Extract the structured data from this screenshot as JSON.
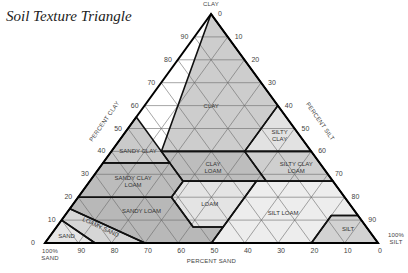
{
  "title": "Soil Texture Triangle",
  "vertices": {
    "clay": {
      "x": 211,
      "y": 14,
      "label": [
        "100%",
        "CLAY"
      ]
    },
    "sand": {
      "x": 45,
      "y": 243,
      "label": [
        "100%",
        "SAND"
      ]
    },
    "silt": {
      "x": 378,
      "y": 243,
      "label": [
        "100%",
        "SILT"
      ]
    }
  },
  "axes": {
    "clay": {
      "title": "PERCENT CLAY",
      "ticks": [
        0,
        10,
        20,
        30,
        40,
        50,
        60,
        70,
        80,
        90
      ]
    },
    "silt": {
      "title": "PERCENT SILT",
      "ticks": [
        0,
        10,
        20,
        30,
        40,
        50,
        60,
        70,
        80,
        90
      ]
    },
    "sand": {
      "title": "PERCENT SAND",
      "ticks": [
        90,
        80,
        70,
        60,
        50,
        40,
        30,
        20,
        10,
        0
      ]
    }
  },
  "regions": [
    {
      "name": "CLAY",
      "fill": "#cdcdcd",
      "label": [
        "CLAY"
      ],
      "label_at": [
        60,
        20
      ],
      "poly": [
        [
          100,
          0
        ],
        [
          40,
          45
        ],
        [
          40,
          20
        ],
        [
          55,
          0
        ],
        [
          60,
          0
        ]
      ],
      "pts": [
        [
          100,
          0,
          0
        ],
        [
          40,
          45,
          15
        ],
        [
          40,
          20,
          40
        ],
        [
          60,
          0,
          40
        ]
      ]
    },
    {
      "name": "SANDY CLAY",
      "fill": "#cacaca",
      "label": [
        "SANDY CLAY"
      ],
      "label_at": [
        40,
        52
      ],
      "pts": [
        [
          55,
          45,
          0
        ],
        [
          35,
          45,
          20
        ],
        [
          35,
          65,
          0
        ]
      ]
    },
    {
      "name": "SILTY CLAY",
      "fill": "#e2e2e2",
      "label": [
        "SILTY",
        "CLAY"
      ],
      "label_at": [
        47,
        6
      ],
      "pts": [
        [
          60,
          0,
          40
        ],
        [
          40,
          20,
          40
        ],
        [
          40,
          0,
          60
        ]
      ]
    },
    {
      "name": "CLAY LOAM",
      "fill": "#bdbdbd",
      "label": [
        "CLAY",
        "LOAM"
      ],
      "label_at": [
        33,
        33
      ],
      "pts": [
        [
          40,
          45,
          15
        ],
        [
          27,
          45,
          28
        ],
        [
          27,
          20,
          53
        ],
        [
          40,
          20,
          40
        ]
      ]
    },
    {
      "name": "SILTY CLAY LOAM",
      "fill": "#cfcfcf",
      "label": [
        "SILTY CLAY",
        "LOAM"
      ],
      "label_at": [
        33,
        8
      ],
      "pts": [
        [
          40,
          20,
          40
        ],
        [
          27,
          20,
          53
        ],
        [
          27,
          0,
          73
        ],
        [
          40,
          0,
          60
        ]
      ]
    },
    {
      "name": "SANDY CLAY LOAM",
      "fill": "#bcbcbc",
      "label": [
        "SANDY CLAY",
        "LOAM"
      ],
      "label_at": [
        27,
        60
      ],
      "pts": [
        [
          35,
          65,
          0
        ],
        [
          35,
          45,
          20
        ],
        [
          27,
          45,
          28
        ],
        [
          20,
          52,
          28
        ],
        [
          20,
          80,
          0
        ]
      ]
    },
    {
      "name": "LOAM",
      "fill": "#e4e4e4",
      "label": [
        "LOAM"
      ],
      "label_at": [
        17,
        42
      ],
      "pts": [
        [
          27,
          45,
          28
        ],
        [
          27,
          23,
          50
        ],
        [
          7,
          43,
          50
        ],
        [
          7,
          52,
          41
        ],
        [
          20,
          52,
          28
        ]
      ]
    },
    {
      "name": "SILT LOAM",
      "fill": "#ededed",
      "label": [
        "SILT LOAM"
      ],
      "label_at": [
        13,
        22
      ],
      "pts": [
        [
          27,
          23,
          50
        ],
        [
          27,
          0,
          73
        ],
        [
          12,
          0,
          88
        ],
        [
          12,
          8,
          80
        ],
        [
          0,
          20,
          80
        ],
        [
          0,
          50,
          50
        ],
        [
          7,
          43,
          50
        ]
      ]
    },
    {
      "name": "SILT",
      "fill": "#d2d2d2",
      "label": [
        "SILT"
      ],
      "label_at": [
        6,
        6
      ],
      "pts": [
        [
          12,
          8,
          80
        ],
        [
          12,
          0,
          88
        ],
        [
          0,
          0,
          100
        ],
        [
          0,
          20,
          80
        ]
      ]
    },
    {
      "name": "SANDY LOAM",
      "fill": "#b8b8b8",
      "label": [
        "SANDY LOAM"
      ],
      "label_at": [
        14,
        64
      ],
      "pts": [
        [
          20,
          80,
          0
        ],
        [
          20,
          52,
          28
        ],
        [
          7,
          52,
          41
        ],
        [
          7,
          43,
          50
        ],
        [
          0,
          50,
          50
        ],
        [
          0,
          70,
          30
        ],
        [
          15,
          85,
          0
        ]
      ]
    },
    {
      "name": "LOAMY SAND",
      "fill": "#d6d6d6",
      "label": [
        "LOAMY SAND"
      ],
      "label_at": [
        7,
        80
      ],
      "pts": [
        [
          15,
          85,
          0
        ],
        [
          0,
          70,
          30
        ],
        [
          0,
          85,
          15
        ],
        [
          10,
          90,
          0
        ]
      ]
    },
    {
      "name": "SAND",
      "fill": "#e6e6e6",
      "label": [
        "SAND"
      ],
      "label_at": [
        3,
        92
      ],
      "pts": [
        [
          10,
          90,
          0
        ],
        [
          0,
          85,
          15
        ],
        [
          0,
          100,
          0
        ]
      ]
    }
  ]
}
